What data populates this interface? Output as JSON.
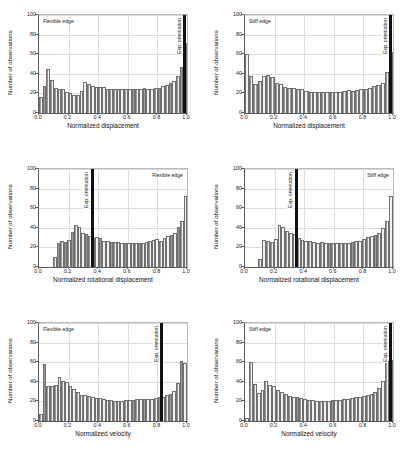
{
  "figure": {
    "title": "",
    "background": "#ffffff",
    "bar_fill": "#f2f2f2",
    "bar_edge": "#6f6f6f",
    "exp_line_color": "#111111",
    "grid_color": "#dcdcdc"
  },
  "common": {
    "ylabel": "Number of observations",
    "yticks": [
      "0",
      "20",
      "40",
      "60",
      "80",
      "100"
    ],
    "xticks": [
      "0.0",
      "0.2",
      "0.4",
      "0.6",
      "0.8",
      "1.0"
    ],
    "exp_label": "Exp. orientation"
  },
  "chart_data": [
    {
      "id": "panel-top-left",
      "type": "bar",
      "title": "",
      "corner_label": "Flexible edge",
      "corner_position": "top-left",
      "xlabel": "Normalized displacement",
      "ylabel": "Number of observations",
      "xlim": [
        0.0,
        1.0
      ],
      "ylim": [
        0,
        100
      ],
      "xticks": [
        0.0,
        0.2,
        0.4,
        0.6,
        0.8,
        1.0
      ],
      "yticks": [
        0,
        20,
        40,
        60,
        80,
        100
      ],
      "grid": true,
      "annotation": {
        "label": "Exp. orientation",
        "x": 0.985
      },
      "bin_centers": [
        0.02,
        0.045,
        0.07,
        0.095,
        0.12,
        0.145,
        0.17,
        0.195,
        0.22,
        0.245,
        0.27,
        0.295,
        0.32,
        0.345,
        0.37,
        0.395,
        0.42,
        0.445,
        0.47,
        0.495,
        0.52,
        0.545,
        0.57,
        0.595,
        0.62,
        0.645,
        0.67,
        0.695,
        0.72,
        0.745,
        0.77,
        0.795,
        0.82,
        0.845,
        0.87,
        0.895,
        0.92,
        0.945,
        0.97,
        0.995
      ],
      "values": [
        16,
        28,
        45,
        34,
        26,
        24,
        25,
        21,
        20,
        18,
        18,
        22,
        32,
        30,
        28,
        27,
        27,
        27,
        25,
        25,
        24,
        24,
        25,
        25,
        24,
        24,
        25,
        25,
        26,
        25,
        25,
        26,
        26,
        28,
        29,
        31,
        33,
        38,
        47,
        71
      ]
    },
    {
      "id": "panel-top-right",
      "type": "bar",
      "title": "",
      "corner_label": "Stiff edge",
      "corner_position": "top-left",
      "xlabel": "Normalized displacement",
      "ylabel": "Number of observations",
      "xlim": [
        0.0,
        1.0
      ],
      "ylim": [
        0,
        100
      ],
      "xticks": [
        0.0,
        0.2,
        0.4,
        0.6,
        0.8,
        1.0
      ],
      "yticks": [
        0,
        20,
        40,
        60,
        80,
        100
      ],
      "grid": true,
      "annotation": {
        "label": "Exp. orientation",
        "x": 0.985
      },
      "bin_centers": [
        0.02,
        0.045,
        0.07,
        0.095,
        0.12,
        0.145,
        0.17,
        0.195,
        0.22,
        0.245,
        0.27,
        0.295,
        0.32,
        0.345,
        0.37,
        0.395,
        0.42,
        0.445,
        0.47,
        0.495,
        0.52,
        0.545,
        0.57,
        0.595,
        0.62,
        0.645,
        0.67,
        0.695,
        0.72,
        0.745,
        0.77,
        0.795,
        0.82,
        0.845,
        0.87,
        0.895,
        0.92,
        0.945,
        0.97,
        0.995
      ],
      "values": [
        60,
        38,
        30,
        33,
        38,
        39,
        37,
        31,
        30,
        27,
        26,
        26,
        25,
        24,
        22,
        21,
        21,
        21,
        21,
        21,
        21,
        21,
        21,
        22,
        23,
        22,
        23,
        25,
        25,
        26,
        28,
        29,
        31,
        42,
        62
      ]
    },
    {
      "id": "panel-middle-left",
      "type": "bar",
      "title": "",
      "corner_label": "Flexible edge",
      "corner_position": "top-right",
      "xlabel": "Normalized rotational displacement",
      "ylabel": "Number of observations",
      "xlim": [
        0.0,
        1.0
      ],
      "ylim": [
        0,
        100
      ],
      "xticks": [
        0.0,
        0.2,
        0.4,
        0.6,
        0.8,
        1.0
      ],
      "yticks": [
        0,
        20,
        40,
        60,
        80,
        100
      ],
      "grid": true,
      "annotation": {
        "label": "Exp. orientation",
        "x": 0.36
      },
      "bin_start": 0.095,
      "values": [
        10,
        24,
        27,
        26,
        28,
        36,
        43,
        41,
        35,
        34,
        32,
        30,
        31,
        30,
        27,
        27,
        26,
        26,
        26,
        25,
        25,
        25,
        24,
        24,
        25,
        25,
        26,
        27,
        28,
        29,
        27,
        30,
        32,
        33,
        35,
        41,
        47,
        72
      ]
    },
    {
      "id": "panel-middle-right",
      "type": "bar",
      "title": "",
      "corner_label": "Stiff edge",
      "corner_position": "top-right",
      "xlabel": "Normalized rotational displacement",
      "ylabel": "Number of observations",
      "xlim": [
        0.0,
        1.0
      ],
      "ylim": [
        0,
        100
      ],
      "xticks": [
        0.0,
        0.2,
        0.4,
        0.6,
        0.8,
        1.0
      ],
      "yticks": [
        0,
        20,
        40,
        60,
        80,
        100
      ],
      "grid": true,
      "annotation": {
        "label": "Exp. orientation",
        "x": 0.345
      },
      "bin_start": 0.09,
      "values": [
        8,
        28,
        27,
        26,
        29,
        43,
        41,
        37,
        35,
        34,
        30,
        28,
        27,
        27,
        26,
        25,
        26,
        25,
        24,
        24,
        25,
        24,
        25,
        25,
        26,
        27,
        27,
        29,
        31,
        32,
        33,
        35,
        40,
        47,
        72
      ]
    },
    {
      "id": "panel-bottom-left",
      "type": "bar",
      "title": "",
      "corner_label": "Flexible edge",
      "corner_position": "top-left",
      "xlabel": "Normalized velocity",
      "ylabel": "Number of observations",
      "xlim": [
        0.0,
        1.0
      ],
      "ylim": [
        0,
        100
      ],
      "xticks": [
        0.0,
        0.2,
        0.4,
        0.6,
        0.8,
        1.0
      ],
      "yticks": [
        0,
        20,
        40,
        60,
        80,
        100
      ],
      "grid": true,
      "annotation": {
        "label": "Exp. orientation",
        "x": 0.83
      },
      "bin_centers": [
        0.012,
        0.037,
        0.062,
        0.087,
        0.112,
        0.137,
        0.162,
        0.187,
        0.212,
        0.237,
        0.262,
        0.287,
        0.312,
        0.337,
        0.362,
        0.387,
        0.412,
        0.437,
        0.462,
        0.487,
        0.512,
        0.537,
        0.562,
        0.587,
        0.612,
        0.637,
        0.662,
        0.687,
        0.712,
        0.737,
        0.762,
        0.787,
        0.812,
        0.837,
        0.862,
        0.887,
        0.912,
        0.937,
        0.962,
        0.987
      ],
      "values": [
        7,
        58,
        36,
        36,
        37,
        45,
        41,
        40,
        36,
        33,
        30,
        27,
        27,
        26,
        25,
        23,
        23,
        22,
        21,
        21,
        20,
        20,
        20,
        21,
        21,
        21,
        22,
        22,
        22,
        22,
        22,
        23,
        24,
        25,
        27,
        28,
        31,
        39,
        61,
        59
      ]
    },
    {
      "id": "panel-bottom-right",
      "type": "bar",
      "title": "",
      "corner_label": "Stiff edge",
      "corner_position": "top-left",
      "xlabel": "Normalized velocity",
      "ylabel": "Number of observations",
      "xlim": [
        0.0,
        1.0
      ],
      "ylim": [
        0,
        100
      ],
      "xticks": [
        0.0,
        0.2,
        0.4,
        0.6,
        0.8,
        1.0
      ],
      "yticks": [
        0,
        20,
        40,
        60,
        80,
        100
      ],
      "grid": true,
      "annotation": {
        "label": "Exp. orientation",
        "x": 0.985
      },
      "bin_centers": [
        0.012,
        0.037,
        0.062,
        0.087,
        0.112,
        0.137,
        0.162,
        0.187,
        0.212,
        0.237,
        0.262,
        0.287,
        0.312,
        0.337,
        0.362,
        0.387,
        0.412,
        0.437,
        0.462,
        0.487,
        0.512,
        0.537,
        0.562,
        0.587,
        0.612,
        0.637,
        0.662,
        0.687,
        0.712,
        0.737,
        0.762,
        0.787,
        0.812,
        0.837,
        0.862,
        0.887,
        0.912,
        0.937,
        0.962,
        0.987
      ],
      "values": [
        3,
        60,
        38,
        29,
        32,
        41,
        37,
        36,
        32,
        30,
        28,
        26,
        25,
        24,
        23,
        22,
        21,
        21,
        20,
        20,
        20,
        20,
        21,
        21,
        21,
        22,
        22,
        23,
        24,
        25,
        26,
        27,
        28,
        30,
        34,
        41,
        61,
        62
      ]
    }
  ]
}
